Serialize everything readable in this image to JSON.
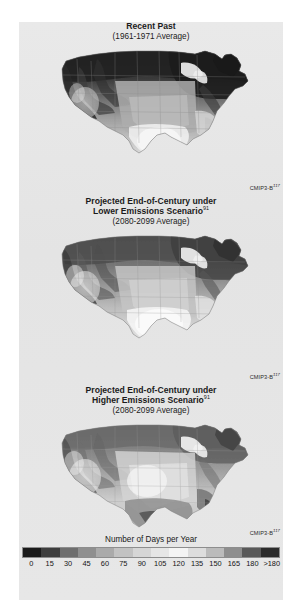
{
  "figure": {
    "background_color": "#e6e6e6",
    "page_background": "#ffffff"
  },
  "panels": [
    {
      "id": "recent-past",
      "title": "Recent Past",
      "title_superscript": "",
      "subtitle": "(1961-1971 Average)",
      "attribution": "CMIP3-B",
      "attribution_superscript": "117",
      "attribution_visible": false
    },
    {
      "id": "lower-emissions",
      "title": "Projected End-of-Century under",
      "title_line2": "Lower Emissions Scenario",
      "title_superscript": "91",
      "subtitle": "(2080-2099 Average)",
      "attribution": "CMIP3-B",
      "attribution_superscript": "117",
      "attribution_visible": true
    },
    {
      "id": "higher-emissions",
      "title": "Projected End-of-Century under",
      "title_line2": "Higher Emissions Scenario",
      "title_superscript": "91",
      "subtitle": "(2080-2099 Average)",
      "attribution": "CMIP3-B",
      "attribution_superscript": "117",
      "attribution_visible": true
    }
  ],
  "attribution_top": {
    "label": "CMIP3-B",
    "superscript": "117"
  },
  "legend": {
    "title": "Number of Days per Year",
    "ticks": [
      "0",
      "15",
      "30",
      "45",
      "60",
      "75",
      "90",
      "105",
      "120",
      "135",
      "150",
      "165",
      "180",
      ">180"
    ],
    "colors": [
      "#1a1a1a",
      "#3d3d3d",
      "#6e6e6e",
      "#8f8f8f",
      "#aaaaaa",
      "#c2c2c2",
      "#d6d6d6",
      "#e6e6e6",
      "#f4f4f4",
      "#dddddd",
      "#bbbbbb",
      "#8e8e8e",
      "#595959",
      "#2b2b2b"
    ]
  },
  "chart_data": {
    "type": "heatmap",
    "title": "Number of Days per Year",
    "subtitle": "Three U.S. maps: Recent Past and projected end-of-century under lower and higher emissions scenarios",
    "xlabel": "",
    "ylabel": "",
    "colorbar_label": "Number of Days per Year",
    "colorbar_ticks": [
      0,
      15,
      30,
      45,
      60,
      75,
      90,
      105,
      120,
      135,
      150,
      165,
      180
    ],
    "colorbar_top_tick_label": ">180",
    "colorbar_range": [
      0,
      180
    ],
    "grid": false,
    "legend_position": "bottom",
    "panels": [
      {
        "name": "Recent Past",
        "period": "1961-1971 Average",
        "regions": [
          {
            "region": "Pacific Northwest / Cascades",
            "value": 150
          },
          {
            "region": "Northern Rockies",
            "value": 170
          },
          {
            "region": "Great Basin / Nevada",
            "value": 90
          },
          {
            "region": "Southwest desert (AZ/NM low)",
            "value": 30
          },
          {
            "region": "Central California Valley",
            "value": 20
          },
          {
            "region": "Northern Plains (ND/MN)",
            "value": 180
          },
          {
            "region": "Central Plains (KS/NE)",
            "value": 105
          },
          {
            "region": "Upper Midwest / Great Lakes",
            "value": 175
          },
          {
            "region": "Northeast / New England",
            "value": 170
          },
          {
            "region": "Mid-Atlantic",
            "value": 120
          },
          {
            "region": "Southeast (GA/AL)",
            "value": 45
          },
          {
            "region": "Florida peninsula",
            "value": 5
          },
          {
            "region": "South Texas",
            "value": 10
          }
        ]
      },
      {
        "name": "Projected End-of-Century under Lower Emissions Scenario",
        "period": "2080-2099 Average",
        "regions": [
          {
            "region": "Pacific Northwest / Cascades",
            "value": 120
          },
          {
            "region": "Northern Rockies",
            "value": 140
          },
          {
            "region": "Great Basin / Nevada",
            "value": 70
          },
          {
            "region": "Southwest desert (AZ/NM low)",
            "value": 15
          },
          {
            "region": "Central California Valley",
            "value": 10
          },
          {
            "region": "Northern Plains (ND/MN)",
            "value": 155
          },
          {
            "region": "Central Plains (KS/NE)",
            "value": 80
          },
          {
            "region": "Upper Midwest / Great Lakes",
            "value": 150
          },
          {
            "region": "Northeast / New England",
            "value": 145
          },
          {
            "region": "Mid-Atlantic",
            "value": 95
          },
          {
            "region": "Southeast (GA/AL)",
            "value": 30
          },
          {
            "region": "Florida peninsula",
            "value": 0
          },
          {
            "region": "South Texas",
            "value": 5
          }
        ]
      },
      {
        "name": "Projected End-of-Century under Higher Emissions Scenario",
        "period": "2080-2099 Average",
        "regions": [
          {
            "region": "Pacific Northwest / Cascades",
            "value": 105
          },
          {
            "region": "Northern Rockies",
            "value": 125
          },
          {
            "region": "Great Basin / Nevada",
            "value": 55
          },
          {
            "region": "Southwest desert (AZ/NM low)",
            "value": 10
          },
          {
            "region": "Central California Valley",
            "value": 5
          },
          {
            "region": "Northern Plains (ND/MN)",
            "value": 140
          },
          {
            "region": "Central Plains (KS/NE)",
            "value": 65
          },
          {
            "region": "Upper Midwest / Great Lakes",
            "value": 135
          },
          {
            "region": "Northeast / New England",
            "value": 130
          },
          {
            "region": "Mid-Atlantic",
            "value": 80
          },
          {
            "region": "Southeast (GA/AL)",
            "value": 20
          },
          {
            "region": "Florida peninsula",
            "value": 0
          },
          {
            "region": "South Texas",
            "value": 0
          }
        ]
      }
    ]
  }
}
